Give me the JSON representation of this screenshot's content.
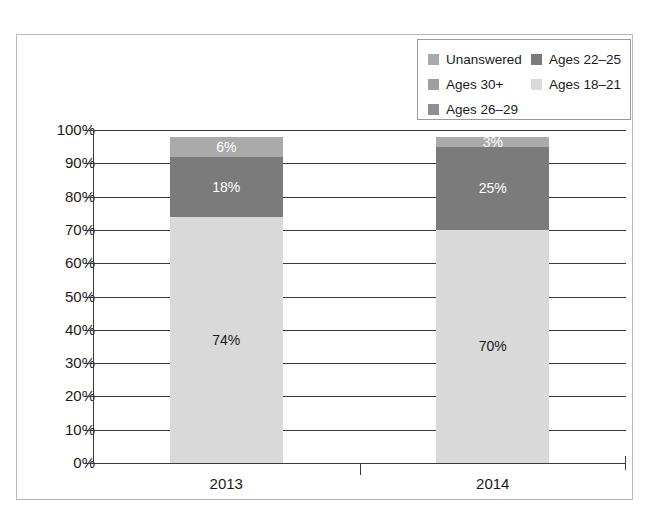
{
  "chart_data": {
    "type": "bar",
    "subtype": "stacked-100-percent-column",
    "title": "",
    "subtitle": "",
    "xlabel": "",
    "ylabel": "",
    "categories": [
      "2013",
      "2014"
    ],
    "ylim": [
      0,
      100
    ],
    "ytick_labels": [
      "0%",
      "10%",
      "20%",
      "30%",
      "40%",
      "50%",
      "60%",
      "70%",
      "80%",
      "90%",
      "100%"
    ],
    "ytick_values": [
      0,
      10,
      20,
      30,
      40,
      50,
      60,
      70,
      80,
      90,
      100
    ],
    "grid": true,
    "grid_axis": "y",
    "legend_position": "top-right",
    "series": [
      {
        "name": "Ages 18–21",
        "color": "#d9d9d9",
        "values": [
          74,
          70
        ],
        "value_labels": [
          "74%",
          "70%"
        ],
        "label_color": "#1a1a1a"
      },
      {
        "name": "Ages 22–25",
        "color": "#7b7b7b",
        "values": [
          18,
          25
        ],
        "value_labels": [
          "18%",
          "25%"
        ],
        "label_color": "#ffffff"
      },
      {
        "name": "Unanswered",
        "color": "#aaaaaa",
        "values": [
          6,
          3
        ],
        "value_labels": [
          "6%",
          "3%"
        ],
        "label_color": "#ffffff"
      },
      {
        "name": "Ages 26–29",
        "color": "#8f8f8f",
        "values": [
          0,
          0
        ],
        "value_labels": [
          "",
          ""
        ],
        "label_color": "#ffffff"
      },
      {
        "name": "Ages 30+",
        "color": "#9e9e9e",
        "values": [
          0,
          0
        ],
        "value_labels": [
          "",
          ""
        ],
        "label_color": "#ffffff"
      }
    ],
    "stack_order_bottom_to_top": [
      "Ages 18–21",
      "Ages 22–25",
      "Unanswered"
    ]
  },
  "legend": {
    "rows": [
      [
        {
          "label": "Unanswered",
          "color": "#aaaaaa"
        },
        {
          "label": "Ages 22–25",
          "color": "#7b7b7b"
        }
      ],
      [
        {
          "label": "Ages 30+",
          "color": "#9e9e9e"
        },
        {
          "label": "Ages 18–21",
          "color": "#d9d9d9"
        }
      ],
      [
        {
          "label": "Ages 26–29",
          "color": "#8f8f8f"
        }
      ]
    ]
  },
  "axis": {
    "y_labels": [
      "100%",
      "90%",
      "80%",
      "70%",
      "60%",
      "50%",
      "40%",
      "30%",
      "20%",
      "10%",
      "0%"
    ],
    "x_labels": [
      "2013",
      "2014"
    ]
  },
  "bars": [
    {
      "category": "2013",
      "segments": [
        {
          "series": "Unanswered",
          "value": 6,
          "label": "6%",
          "color": "#aaaaaa",
          "label_color": "#ffffff"
        },
        {
          "series": "Ages 22–25",
          "value": 18,
          "label": "18%",
          "color": "#7b7b7b",
          "label_color": "#ffffff"
        },
        {
          "series": "Ages 18–21",
          "value": 74,
          "label": "74%",
          "color": "#d9d9d9",
          "label_color": "#1a1a1a"
        }
      ]
    },
    {
      "category": "2014",
      "segments": [
        {
          "series": "Unanswered",
          "value": 3,
          "label": "3%",
          "color": "#aaaaaa",
          "label_color": "#ffffff"
        },
        {
          "series": "Ages 22–25",
          "value": 25,
          "label": "25%",
          "color": "#7b7b7b",
          "label_color": "#ffffff"
        },
        {
          "series": "Ages 18–21",
          "value": 70,
          "label": "70%",
          "color": "#d9d9d9",
          "label_color": "#1a1a1a"
        }
      ]
    }
  ],
  "colors": {
    "axis": "#3a3a3a",
    "frame": "#b9b9b9",
    "legend_border": "#9a9a9a",
    "background": "#ffffff",
    "text": "#1a1a1a"
  }
}
